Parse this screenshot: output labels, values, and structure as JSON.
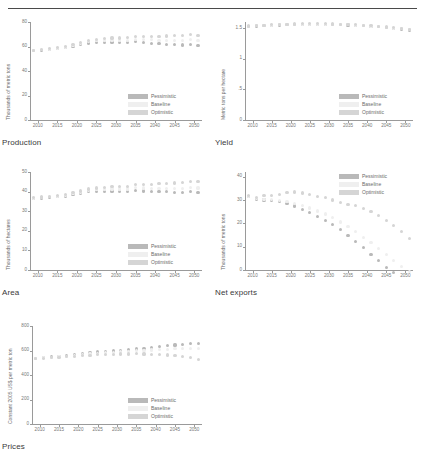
{
  "document": {
    "header_text": "",
    "figure_captions": [
      "Production",
      "Yield",
      "Area",
      "Net exports",
      "Prices"
    ]
  },
  "legend": {
    "entries": [
      {
        "label": "Pessimistic",
        "color": "#b9b9b9"
      },
      {
        "label": "Baseline",
        "color": "#efefef"
      },
      {
        "label": "Optimistic",
        "color": "#d5d5d5"
      }
    ]
  },
  "xaxis": {
    "ticks": [
      "2010",
      "2015",
      "2020",
      "2025",
      "2030",
      "2035",
      "2040",
      "2045",
      "2050"
    ],
    "min": 2008,
    "max": 2052
  },
  "chart_data": [
    {
      "type": "scatter",
      "title": "Production",
      "caption": "Production",
      "xlabel": "",
      "ylabel": "Thousands of metric tons",
      "ylim": [
        0,
        80
      ],
      "yticks": [
        0,
        20,
        40,
        60,
        80
      ],
      "xlim": [
        2008,
        2052
      ],
      "xticks": [
        2010,
        2015,
        2020,
        2025,
        2030,
        2035,
        2040,
        2045,
        2050
      ],
      "grid": false,
      "legend_position": "bottom-right",
      "x": [
        2009,
        2011,
        2013,
        2015,
        2017,
        2019,
        2021,
        2023,
        2025,
        2027,
        2029,
        2031,
        2033,
        2035,
        2037,
        2039,
        2041,
        2043,
        2045,
        2047,
        2049,
        2051
      ],
      "series": [
        {
          "name": "Pessimistic",
          "color": "#b9b9b9",
          "values": [
            56.5,
            57.0,
            57.6,
            58.2,
            58.9,
            60.2,
            61.4,
            62.8,
            63.4,
            63.2,
            63.6,
            63.3,
            63.0,
            63.8,
            63.1,
            62.7,
            62.2,
            61.9,
            61.4,
            61.2,
            61.8,
            60.9
          ]
        },
        {
          "name": "Baseline",
          "color": "#efefef",
          "values": [
            56.8,
            57.4,
            58.0,
            58.7,
            59.6,
            61.0,
            62.4,
            63.9,
            64.6,
            64.7,
            65.2,
            65.1,
            65.0,
            66.0,
            65.6,
            65.4,
            65.2,
            65.1,
            64.9,
            64.9,
            65.6,
            64.9
          ]
        },
        {
          "name": "Optimistic",
          "color": "#d5d5d5",
          "values": [
            57.0,
            57.6,
            58.3,
            59.1,
            60.1,
            61.7,
            63.3,
            65.0,
            65.9,
            66.2,
            66.9,
            67.0,
            67.1,
            68.3,
            68.2,
            68.3,
            68.4,
            68.6,
            68.7,
            68.9,
            69.8,
            69.3
          ]
        }
      ]
    },
    {
      "type": "scatter",
      "title": "Yield",
      "caption": "Yield",
      "xlabel": "",
      "ylabel": "Metric tons per hectare",
      "ylim": [
        0,
        1.6
      ],
      "yticks": [
        "0",
        ".5",
        "1",
        "1.5"
      ],
      "xlim": [
        2008,
        2052
      ],
      "xticks": [
        2010,
        2015,
        2020,
        2025,
        2030,
        2035,
        2040,
        2045,
        2050
      ],
      "grid": false,
      "legend_position": "bottom-right",
      "x": [
        2009,
        2011,
        2013,
        2015,
        2017,
        2019,
        2021,
        2023,
        2025,
        2027,
        2029,
        2031,
        2033,
        2035,
        2037,
        2039,
        2041,
        2043,
        2045,
        2047,
        2049,
        2051
      ],
      "series": [
        {
          "name": "Pessimistic",
          "color": "#b9b9b9",
          "values": [
            1.53,
            1.535,
            1.54,
            1.548,
            1.552,
            1.556,
            1.558,
            1.56,
            1.561,
            1.561,
            1.56,
            1.558,
            1.555,
            1.551,
            1.545,
            1.538,
            1.53,
            1.521,
            1.51,
            1.498,
            1.485,
            1.47
          ]
        },
        {
          "name": "Baseline",
          "color": "#efefef",
          "values": [
            1.532,
            1.538,
            1.544,
            1.551,
            1.556,
            1.56,
            1.563,
            1.565,
            1.566,
            1.566,
            1.565,
            1.563,
            1.56,
            1.556,
            1.55,
            1.543,
            1.535,
            1.526,
            1.515,
            1.503,
            1.49,
            1.475
          ]
        },
        {
          "name": "Optimistic",
          "color": "#d5d5d5",
          "values": [
            1.534,
            1.54,
            1.547,
            1.554,
            1.559,
            1.564,
            1.567,
            1.569,
            1.57,
            1.57,
            1.569,
            1.567,
            1.564,
            1.56,
            1.554,
            1.547,
            1.539,
            1.53,
            1.519,
            1.507,
            1.494,
            1.479
          ]
        }
      ]
    },
    {
      "type": "scatter",
      "title": "Area",
      "caption": "Area",
      "xlabel": "",
      "ylabel": "Thousands of hectares",
      "ylim": [
        0,
        50
      ],
      "yticks": [
        0,
        10,
        20,
        30,
        40,
        50
      ],
      "xlim": [
        2008,
        2052
      ],
      "xticks": [
        2010,
        2015,
        2020,
        2025,
        2030,
        2035,
        2040,
        2045,
        2050
      ],
      "grid": false,
      "legend_position": "bottom-right",
      "x": [
        2009,
        2011,
        2013,
        2015,
        2017,
        2019,
        2021,
        2023,
        2025,
        2027,
        2029,
        2031,
        2033,
        2035,
        2037,
        2039,
        2041,
        2043,
        2045,
        2047,
        2049,
        2051
      ],
      "series": [
        {
          "name": "Pessimistic",
          "color": "#b9b9b9",
          "values": [
            36.5,
            36.7,
            37.0,
            37.3,
            37.6,
            38.4,
            39.1,
            39.9,
            40.2,
            40.1,
            40.3,
            40.2,
            40.1,
            40.6,
            40.3,
            40.1,
            40.0,
            39.9,
            39.7,
            39.6,
            40.0,
            39.5
          ]
        },
        {
          "name": "Baseline",
          "color": "#efefef",
          "values": [
            36.7,
            37.0,
            37.3,
            37.7,
            38.1,
            38.9,
            39.7,
            40.6,
            41.0,
            41.0,
            41.3,
            41.3,
            41.3,
            41.9,
            41.8,
            41.7,
            41.7,
            41.7,
            41.7,
            41.7,
            42.2,
            41.8
          ]
        },
        {
          "name": "Optimistic",
          "color": "#d5d5d5",
          "values": [
            36.9,
            37.2,
            37.6,
            38.0,
            38.5,
            39.4,
            40.3,
            41.3,
            41.8,
            42.0,
            42.5,
            42.6,
            42.8,
            43.6,
            43.7,
            43.8,
            44.0,
            44.2,
            44.4,
            44.6,
            45.3,
            45.0
          ]
        }
      ]
    },
    {
      "type": "scatter",
      "title": "Net exports",
      "caption": "Net exports",
      "xlabel": "",
      "ylabel": "Thousands of metric tons",
      "ylim": [
        0,
        42
      ],
      "yticks": [
        0,
        10,
        20,
        30,
        40
      ],
      "xlim": [
        2008,
        2052
      ],
      "xticks": [
        2010,
        2015,
        2020,
        2025,
        2030,
        2035,
        2040,
        2045,
        2050
      ],
      "grid": false,
      "legend_position": "top-right",
      "x": [
        2009,
        2011,
        2013,
        2015,
        2017,
        2019,
        2021,
        2023,
        2025,
        2027,
        2029,
        2031,
        2033,
        2035,
        2037,
        2039,
        2041,
        2043,
        2045,
        2047,
        2049,
        2051
      ],
      "series": [
        {
          "name": "Pessimistic",
          "color": "#b9b9b9",
          "values": [
            31.5,
            30.2,
            30.0,
            29.8,
            29.2,
            28.6,
            27.4,
            25.9,
            24.6,
            23.0,
            21.3,
            19.4,
            17.2,
            14.8,
            12.3,
            9.6,
            6.8,
            4.0,
            1.2,
            -1.0,
            -2.0,
            -2.5
          ]
        },
        {
          "name": "Baseline",
          "color": "#efefef",
          "values": [
            31.6,
            30.5,
            30.3,
            30.1,
            29.7,
            29.4,
            28.6,
            27.5,
            26.6,
            25.3,
            24.0,
            22.4,
            20.6,
            18.6,
            16.5,
            14.1,
            11.7,
            9.2,
            6.6,
            4.0,
            1.4,
            -0.8
          ]
        },
        {
          "name": "Optimistic",
          "color": "#d5d5d5",
          "values": [
            31.8,
            31.0,
            31.8,
            32.0,
            32.4,
            33.2,
            33.4,
            33.0,
            32.3,
            31.4,
            31.0,
            30.0,
            29.0,
            28.2,
            27.5,
            26.4,
            25.0,
            23.2,
            21.3,
            19.0,
            16.5,
            13.5
          ]
        }
      ]
    },
    {
      "type": "scatter",
      "title": "Prices",
      "caption": "Prices",
      "xlabel": "",
      "ylabel": "Constant 2005 US$ per metric ton",
      "ylim": [
        0,
        800
      ],
      "yticks": [
        0,
        200,
        400,
        600,
        800
      ],
      "xlim": [
        2008,
        2052
      ],
      "xticks": [
        2010,
        2015,
        2020,
        2025,
        2030,
        2035,
        2040,
        2045,
        2050
      ],
      "grid": false,
      "legend_position": "bottom-right",
      "x": [
        2009,
        2011,
        2013,
        2015,
        2017,
        2019,
        2021,
        2023,
        2025,
        2027,
        2029,
        2031,
        2033,
        2035,
        2037,
        2039,
        2041,
        2043,
        2045,
        2047,
        2049,
        2051
      ],
      "series": [
        {
          "name": "Pessimistic",
          "color": "#b9b9b9",
          "values": [
            537,
            543,
            548,
            553,
            558,
            565,
            572,
            580,
            588,
            592,
            596,
            600,
            605,
            612,
            618,
            624,
            630,
            638,
            645,
            650,
            655,
            660
          ]
        },
        {
          "name": "Baseline",
          "color": "#efefef",
          "values": [
            535,
            540,
            545,
            550,
            554,
            560,
            565,
            571,
            578,
            582,
            585,
            588,
            592,
            597,
            601,
            604,
            607,
            611,
            614,
            615,
            616,
            616
          ]
        },
        {
          "name": "Optimistic",
          "color": "#d5d5d5",
          "values": [
            533,
            537,
            541,
            545,
            549,
            554,
            558,
            562,
            567,
            569,
            570,
            571,
            572,
            573,
            572,
            570,
            567,
            563,
            558,
            550,
            540,
            528
          ]
        }
      ]
    }
  ]
}
